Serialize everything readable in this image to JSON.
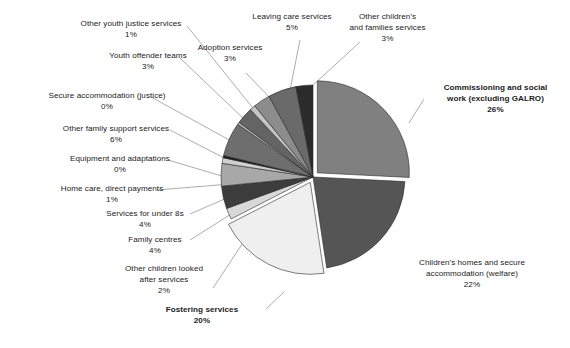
{
  "chart_data": {
    "type": "pie",
    "title": "",
    "subtitle": "",
    "xlabel": "",
    "ylabel": "",
    "legend_position": "labels-with-leader-lines",
    "grid": false,
    "value_unit": "%",
    "categories": [
      "Commissioning and social work (excluding GALRO)",
      "Children's homes and secure accommodation (welfare)",
      "Fostering services",
      "Other children looked after services",
      "Family centres",
      "Services for under 8s",
      "Home care, direct payments",
      "Equipment and adaptations",
      "Other family support services",
      "Secure accommodation (justice)",
      "Youth offender teams",
      "Other youth justice services",
      "Adoption services",
      "Leaving care services",
      "Other children's and families services"
    ],
    "values": [
      26,
      22,
      20,
      2,
      4,
      4,
      1,
      0,
      6,
      0,
      3,
      1,
      3,
      5,
      3
    ],
    "slices": [
      {
        "label_lines": [
          "Commissioning and social",
          "work (excluding GALRO)"
        ],
        "value_label": "26%",
        "value": 26,
        "bold": true,
        "color": "#808080",
        "exploded": true
      },
      {
        "label_lines": [
          "Children's homes and secure",
          "accommodation (welfare)"
        ],
        "value_label": "22%",
        "value": 22,
        "bold": false,
        "color": "#555555",
        "exploded": false
      },
      {
        "label_lines": [
          "Fostering services"
        ],
        "value_label": "20%",
        "value": 20,
        "bold": true,
        "color": "#efefef",
        "exploded": true
      },
      {
        "label_lines": [
          "Other children looked",
          "after services"
        ],
        "value_label": "2%",
        "value": 2,
        "bold": false,
        "color": "#d8d8d8",
        "exploded": false
      },
      {
        "label_lines": [
          "Family centres"
        ],
        "value_label": "4%",
        "value": 4,
        "bold": false,
        "color": "#3c3c3c",
        "exploded": false
      },
      {
        "label_lines": [
          "Services for under 8s"
        ],
        "value_label": "4%",
        "value": 4,
        "bold": false,
        "color": "#a8a8a8",
        "exploded": false
      },
      {
        "label_lines": [
          "Home care, direct payments"
        ],
        "value_label": "1%",
        "value": 1,
        "bold": false,
        "color": "#cfcfcf",
        "exploded": false
      },
      {
        "label_lines": [
          "Equipment and adaptations"
        ],
        "value_label": "0%",
        "value": 0.4,
        "bold": false,
        "color": "#1d1d1d",
        "exploded": false
      },
      {
        "label_lines": [
          "Other family support services"
        ],
        "value_label": "6%",
        "value": 6,
        "bold": false,
        "color": "#6e6e6e",
        "exploded": false
      },
      {
        "label_lines": [
          "Secure accommodation (justice)"
        ],
        "value_label": "0%",
        "value": 0.4,
        "bold": false,
        "color": "#bdbdbd",
        "exploded": false
      },
      {
        "label_lines": [
          "Youth offender teams"
        ],
        "value_label": "3%",
        "value": 3,
        "bold": false,
        "color": "#646464",
        "exploded": false
      },
      {
        "label_lines": [
          "Other youth justice services"
        ],
        "value_label": "1%",
        "value": 1,
        "bold": false,
        "color": "#c4c4c4",
        "exploded": false
      },
      {
        "label_lines": [
          "Adoption services"
        ],
        "value_label": "3%",
        "value": 3,
        "bold": false,
        "color": "#8c8c8c",
        "exploded": false
      },
      {
        "label_lines": [
          "Leaving care services"
        ],
        "value_label": "5%",
        "value": 5,
        "bold": false,
        "color": "#6a6a6a",
        "exploded": false
      },
      {
        "label_lines": [
          "Other children's",
          "and families services"
        ],
        "value_label": "3%",
        "value": 3,
        "bold": false,
        "color": "#2b2b2b",
        "exploded": false
      }
    ]
  },
  "labels": {
    "other_youth_justice_services": {
      "lines": [
        "Other youth justice services"
      ],
      "value": "1%"
    },
    "youth_offender_teams": {
      "lines": [
        "Youth offender teams"
      ],
      "value": "3%"
    },
    "secure_accommodation_justice": {
      "lines": [
        "Secure accommodation (justice)"
      ],
      "value": "0%"
    },
    "other_family_support_services": {
      "lines": [
        "Other family support services"
      ],
      "value": "6%"
    },
    "equipment_and_adaptations": {
      "lines": [
        "Equipment and adaptations"
      ],
      "value": "0%"
    },
    "home_care_direct_payments": {
      "lines": [
        "Home care, direct payments"
      ],
      "value": "1%"
    },
    "services_for_under_8s": {
      "lines": [
        "Services for under 8s"
      ],
      "value": "4%"
    },
    "family_centres": {
      "lines": [
        "Family centres"
      ],
      "value": "4%"
    },
    "other_children_looked_after_services": {
      "lines": [
        "Other children looked",
        "after services"
      ],
      "value": "2%"
    },
    "fostering_services": {
      "lines": [
        "Fostering services"
      ],
      "value": "20%"
    },
    "adoption_services": {
      "lines": [
        "Adoption services"
      ],
      "value": "3%"
    },
    "leaving_care_services": {
      "lines": [
        "Leaving care services"
      ],
      "value": "5%"
    },
    "other_childrens_and_families_services": {
      "lines": [
        "Other children's",
        "and families services"
      ],
      "value": "3%"
    },
    "commissioning_and_social_work": {
      "lines": [
        "Commissioning and social",
        "work (excluding GALRO)"
      ],
      "value": "26%"
    },
    "childrens_homes_and_secure_accommodation": {
      "lines": [
        "Children's homes and secure",
        "accommodation (welfare)"
      ],
      "value": "22%"
    }
  },
  "geometry": {
    "center_x": 313,
    "center_y": 177,
    "radius": 92
  }
}
